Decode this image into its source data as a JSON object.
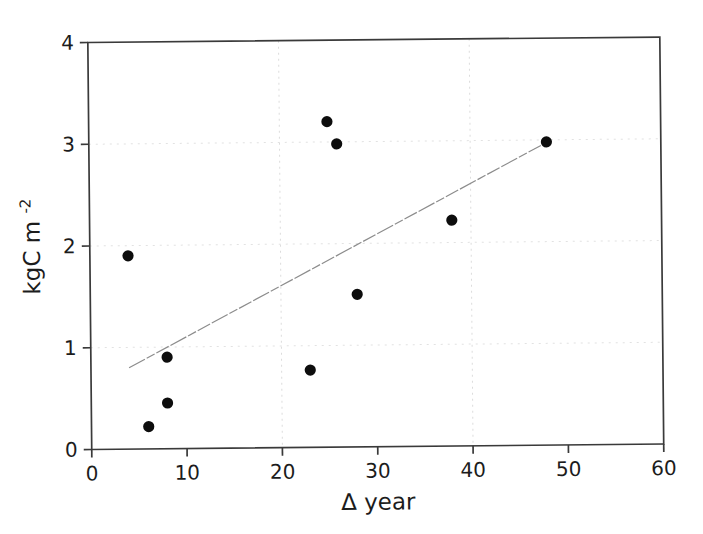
{
  "figure": {
    "background": "#ffffff",
    "scan_skew_deg": -0.55
  },
  "chart_data": {
    "type": "scatter",
    "title": "",
    "xlabel": "Δ year",
    "ylabel_base": "kgC m",
    "ylabel_sup": "-2",
    "xlim": [
      0,
      60
    ],
    "ylim": [
      0,
      4
    ],
    "x_ticks": [
      0,
      10,
      20,
      30,
      40,
      50,
      60
    ],
    "y_ticks": [
      0,
      1,
      2,
      3,
      4
    ],
    "grid": "faint dotted, partial (scan)",
    "gridlines": {
      "x": [
        20,
        40
      ],
      "y": [
        1,
        2,
        3
      ]
    },
    "legend": "none",
    "points": [
      [
        4,
        1.9
      ],
      [
        6,
        0.22
      ],
      [
        8,
        0.45
      ],
      [
        8,
        0.9
      ],
      [
        23,
        0.76
      ],
      [
        25,
        3.2
      ],
      [
        26,
        2.98
      ],
      [
        28,
        1.5
      ],
      [
        38,
        2.22
      ],
      [
        48,
        2.98
      ]
    ],
    "trendline": {
      "x1": 4,
      "y1": 0.8,
      "x2": 47.5,
      "y2": 2.95
    },
    "colors": {
      "point": "#0d0d0d",
      "axis": "#3a3a3a",
      "trendline": "#8c8c8c",
      "gridline": "#dcdcdc",
      "tick_label": "#1c1c1c"
    }
  }
}
